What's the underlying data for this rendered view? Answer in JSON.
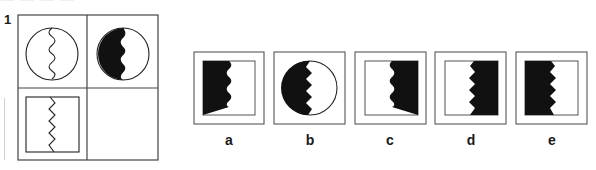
{
  "header": {
    "cropped_heading": "— — — —"
  },
  "question": {
    "number": "1",
    "matrix": {
      "rows": 2,
      "cols": 2,
      "cells": [
        {
          "position": "top-left",
          "shape": "circle",
          "divider": "wavy-line",
          "fill": "none"
        },
        {
          "position": "top-right",
          "shape": "circle",
          "divider": "wavy-line",
          "fill": "left-black"
        },
        {
          "position": "bottom-left",
          "shape": "square",
          "divider": "zigzag-line",
          "fill": "none"
        },
        {
          "position": "bottom-right",
          "shape": "empty",
          "divider": "none",
          "fill": "none"
        }
      ]
    },
    "options": [
      {
        "label": "a",
        "shape": "square",
        "divider": "wavy",
        "fill": "left-black"
      },
      {
        "label": "b",
        "shape": "circle",
        "divider": "zigzag",
        "fill": "left-black"
      },
      {
        "label": "c",
        "shape": "square",
        "divider": "wavy",
        "fill": "right-black"
      },
      {
        "label": "d",
        "shape": "square",
        "divider": "zigzag",
        "fill": "right-black"
      },
      {
        "label": "e",
        "shape": "square",
        "divider": "zigzag",
        "fill": "left-black"
      }
    ]
  },
  "colors": {
    "ink": "#1a1a1a",
    "frame": "#555555",
    "background": "#ffffff"
  }
}
